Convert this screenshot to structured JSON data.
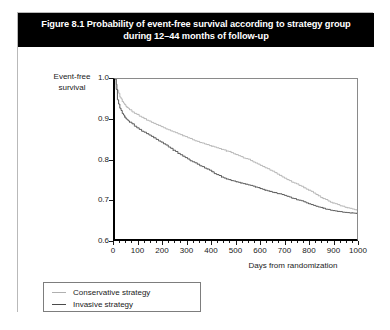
{
  "figure": {
    "title": "Figure 8.1 Probability of event-free survival according to strategy group during 12–44 months of follow-up"
  },
  "chart_data": {
    "type": "line",
    "title": "Figure 8.1 Probability of event-free survival according to strategy group during 12–44 months of follow-up",
    "xlabel": "Days from randomization",
    "ylabel": "Event-free survival",
    "xlim": [
      0,
      1000
    ],
    "ylim": [
      0.6,
      1.0
    ],
    "xticks": [
      0,
      100,
      200,
      300,
      400,
      500,
      600,
      700,
      800,
      900,
      1000
    ],
    "yticks": [
      0.6,
      0.7,
      0.8,
      0.9,
      1.0
    ],
    "grid": false,
    "legend_position": "below-left",
    "series": [
      {
        "name": "Conservative strategy",
        "color": "#b0b0b0",
        "x": [
          0,
          10,
          20,
          30,
          40,
          50,
          60,
          80,
          100,
          120,
          140,
          160,
          180,
          200,
          220,
          240,
          260,
          280,
          300,
          320,
          340,
          360,
          380,
          400,
          420,
          440,
          460,
          480,
          500,
          520,
          540,
          560,
          580,
          600,
          620,
          640,
          660,
          680,
          700,
          720,
          740,
          760,
          780,
          800,
          820,
          840,
          860,
          880,
          900,
          920,
          940,
          960,
          980,
          1000
        ],
        "y": [
          1.0,
          0.972,
          0.955,
          0.944,
          0.936,
          0.929,
          0.923,
          0.914,
          0.907,
          0.901,
          0.895,
          0.889,
          0.884,
          0.878,
          0.873,
          0.868,
          0.863,
          0.858,
          0.853,
          0.848,
          0.844,
          0.84,
          0.836,
          0.832,
          0.828,
          0.824,
          0.82,
          0.816,
          0.811,
          0.806,
          0.801,
          0.796,
          0.79,
          0.784,
          0.778,
          0.772,
          0.766,
          0.759,
          0.752,
          0.746,
          0.74,
          0.734,
          0.728,
          0.722,
          0.715,
          0.708,
          0.701,
          0.695,
          0.69,
          0.686,
          0.682,
          0.678,
          0.675,
          0.672
        ]
      },
      {
        "name": "Invasive strategy",
        "color": "#4a4a4a",
        "x": [
          0,
          10,
          20,
          30,
          40,
          50,
          60,
          80,
          100,
          120,
          140,
          160,
          180,
          200,
          220,
          240,
          260,
          280,
          300,
          320,
          340,
          360,
          380,
          400,
          420,
          440,
          460,
          480,
          500,
          520,
          540,
          560,
          580,
          600,
          620,
          640,
          660,
          680,
          700,
          720,
          740,
          760,
          780,
          800,
          820,
          840,
          860,
          880,
          900,
          920,
          940,
          960,
          980,
          1000
        ],
        "y": [
          1.0,
          0.948,
          0.927,
          0.914,
          0.905,
          0.898,
          0.892,
          0.882,
          0.874,
          0.867,
          0.86,
          0.853,
          0.845,
          0.838,
          0.83,
          0.822,
          0.814,
          0.807,
          0.8,
          0.793,
          0.787,
          0.781,
          0.775,
          0.768,
          0.761,
          0.755,
          0.75,
          0.746,
          0.743,
          0.74,
          0.737,
          0.734,
          0.73,
          0.726,
          0.722,
          0.719,
          0.716,
          0.713,
          0.709,
          0.705,
          0.701,
          0.697,
          0.693,
          0.688,
          0.684,
          0.68,
          0.677,
          0.674,
          0.671,
          0.669,
          0.667,
          0.666,
          0.665,
          0.664
        ]
      }
    ]
  },
  "legend": {
    "items": [
      {
        "label": "Conservative strategy",
        "color": "#b0b0b0"
      },
      {
        "label": "Invasive strategy",
        "color": "#4a4a4a"
      }
    ]
  }
}
